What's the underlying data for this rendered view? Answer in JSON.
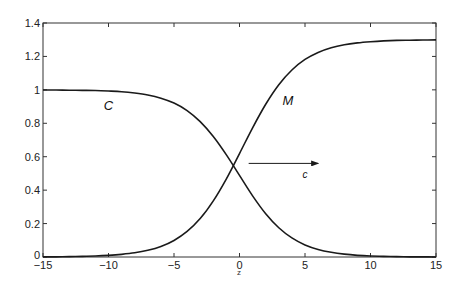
{
  "chart_data": {
    "type": "line",
    "title": "",
    "xlabel": "z",
    "ylabel": "",
    "xlim": [
      -15,
      15
    ],
    "ylim": [
      0,
      1.4
    ],
    "grid": false,
    "legend": null,
    "x_ticks": [
      -15,
      -10,
      -5,
      0,
      5,
      10,
      15
    ],
    "x_tick_labels": [
      "−15",
      "−10",
      "−5",
      "0",
      "5",
      "10",
      "15"
    ],
    "y_ticks": [
      0,
      0.2,
      0.4,
      0.6,
      0.8,
      1,
      1.2,
      1.4
    ],
    "y_tick_labels": [
      "0",
      "0.2",
      "0.4",
      "0.6",
      "0.8",
      "1",
      "1.2",
      "1.4"
    ],
    "x": [
      -15,
      -14,
      -13,
      -12,
      -11,
      -10,
      -9,
      -8,
      -7,
      -6,
      -5,
      -4,
      -3,
      -2,
      -1,
      0,
      1,
      2,
      3,
      4,
      5,
      6,
      7,
      8,
      9,
      10,
      11,
      12,
      13,
      14,
      15
    ],
    "series": [
      {
        "name": "C",
        "values": [
          0.999,
          0.999,
          0.998,
          0.997,
          0.996,
          0.993,
          0.989,
          0.981,
          0.969,
          0.95,
          0.921,
          0.876,
          0.81,
          0.721,
          0.611,
          0.488,
          0.366,
          0.259,
          0.175,
          0.114,
          0.072,
          0.045,
          0.028,
          0.017,
          0.01,
          0.006,
          0.004,
          0.002,
          0.001,
          0.001,
          0.0
        ]
      },
      {
        "name": "M",
        "values": [
          0.001,
          0.001,
          0.002,
          0.004,
          0.006,
          0.01,
          0.016,
          0.025,
          0.04,
          0.063,
          0.099,
          0.153,
          0.23,
          0.336,
          0.468,
          0.619,
          0.773,
          0.914,
          1.031,
          1.119,
          1.182,
          1.224,
          1.252,
          1.27,
          1.281,
          1.288,
          1.293,
          1.296,
          1.297,
          1.298,
          1.299
        ]
      }
    ],
    "annotations": [
      {
        "text": "C",
        "x": -10,
        "y": 0.88,
        "style": "italic"
      },
      {
        "text": "M",
        "x": 3.7,
        "y": 0.91,
        "style": "italic"
      },
      {
        "text": "c",
        "x": 5.0,
        "y": 0.47,
        "style": "italic"
      },
      {
        "type": "arrow",
        "from": [
          0.7,
          0.56
        ],
        "to": [
          6.0,
          0.56
        ],
        "label": "c"
      }
    ]
  },
  "colors": {
    "line": "#1a1a1a",
    "axis": "#333333",
    "background": "#ffffff"
  }
}
